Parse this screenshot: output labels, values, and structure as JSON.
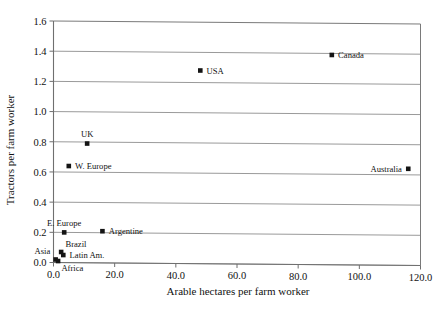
{
  "chart_data": {
    "type": "scatter",
    "title": "",
    "xlabel": "Arable hectares per farm worker",
    "ylabel": "Tractors per farm worker",
    "xlim": [
      0.0,
      120.0
    ],
    "ylim": [
      0.0,
      1.6
    ],
    "xticks": [
      "0.0",
      "20.0",
      "40.0",
      "60.0",
      "80.0",
      "100.0",
      "120.0"
    ],
    "yticks": [
      "0.0",
      "0.2",
      "0.4",
      "0.6",
      "0.8",
      "1.0",
      "1.2",
      "1.4",
      "1.6"
    ],
    "xtick_values": [
      0,
      20,
      40,
      60,
      80,
      100,
      120
    ],
    "ytick_values": [
      0.0,
      0.2,
      0.4,
      0.6,
      0.8,
      1.0,
      1.2,
      1.4,
      1.6
    ],
    "grid": "horizontal",
    "legend": "none",
    "marker_style": "filled-square",
    "marker_color": "#141414",
    "points": [
      {
        "label": "Canada",
        "x": 91.0,
        "y": 1.39,
        "label_pos": "right"
      },
      {
        "label": "USA",
        "x": 48.0,
        "y": 1.28,
        "label_pos": "right"
      },
      {
        "label": "UK",
        "x": 11.0,
        "y": 0.79,
        "label_pos": "above"
      },
      {
        "label": "Australia",
        "x": 116.0,
        "y": 0.64,
        "label_pos": "left"
      },
      {
        "label": "W. Europe",
        "x": 5.0,
        "y": 0.64,
        "label_pos": "right"
      },
      {
        "label": "Argentine",
        "x": 16.0,
        "y": 0.21,
        "label_pos": "right"
      },
      {
        "label": "E. Europe",
        "x": 3.5,
        "y": 0.2,
        "label_pos": "above"
      },
      {
        "label": "Brazil",
        "x": 2.5,
        "y": 0.07,
        "label_pos": "above-right"
      },
      {
        "label": "Latin Am.",
        "x": 3.2,
        "y": 0.05,
        "label_pos": "right"
      },
      {
        "label": "Asia",
        "x": 0.7,
        "y": 0.02,
        "label_pos": "above-left"
      },
      {
        "label": "Africa",
        "x": 1.5,
        "y": 0.01,
        "label_pos": "below-right"
      }
    ]
  }
}
